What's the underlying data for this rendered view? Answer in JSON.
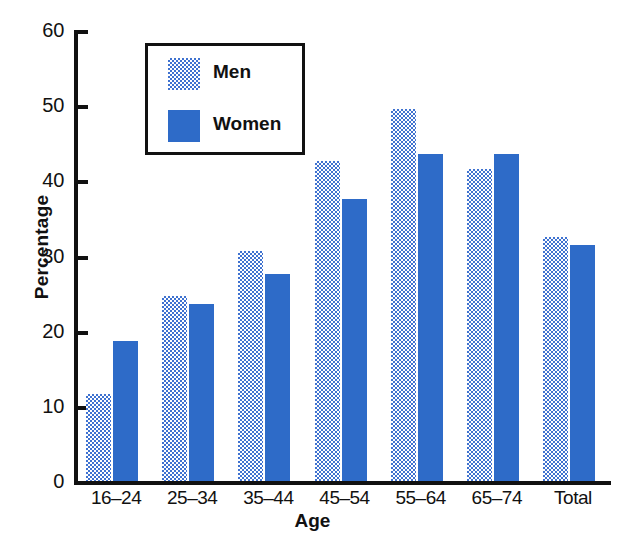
{
  "chart_data": {
    "type": "bar",
    "title": "",
    "xlabel": "Age",
    "ylabel": "Percentage",
    "categories": [
      "16–24",
      "25–34",
      "35–44",
      "45–54",
      "55–64",
      "65–74",
      "Total"
    ],
    "series": [
      {
        "name": "Men",
        "values": [
          11.8,
          24.9,
          30.9,
          42.8,
          49.7,
          41.8,
          32.7
        ]
      },
      {
        "name": "Women",
        "values": [
          18.9,
          23.8,
          27.8,
          37.8,
          43.8,
          43.8,
          31.7
        ]
      }
    ],
    "ylim": [
      0,
      60
    ],
    "yticks": [
      0,
      10,
      20,
      30,
      40,
      50,
      60
    ],
    "ytick_labels": [
      "0",
      "10",
      "20",
      "30",
      "40",
      "50",
      "60"
    ],
    "grid": false,
    "legend_position": "upper-left-inside",
    "colors": {
      "men": "#8fa8e0",
      "women": "#2e6bc8",
      "axis": "#111111",
      "background": "#ffffff"
    }
  },
  "legend": {
    "items": [
      {
        "label": "Men",
        "swatch": "men-swatch"
      },
      {
        "label": "Women",
        "swatch": "women-swatch"
      }
    ]
  }
}
